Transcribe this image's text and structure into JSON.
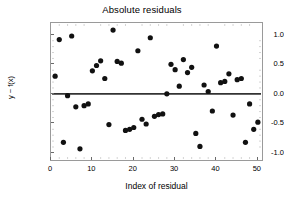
{
  "chart_data": {
    "type": "scatter",
    "title": "Absolute residuals",
    "xlabel": "Index of residual",
    "ylabel": "y − f(x)",
    "xlim": [
      0,
      51
    ],
    "ylim": [
      -1.12,
      1.2
    ],
    "grid": false,
    "legend": null,
    "marker": {
      "shape": "circle",
      "color": "#111111",
      "size_px": 5.2
    },
    "reference_line": {
      "orientation": "horizontal",
      "y": 0.0,
      "color": "#333333",
      "width_px": 1.8
    },
    "xticks": [
      0,
      10,
      20,
      30,
      40,
      50
    ],
    "xtick_labels": [
      "0",
      "10",
      "20",
      "30",
      "40",
      "50"
    ],
    "yticks": [
      -1.0,
      -0.5,
      0.0,
      0.5,
      1.0
    ],
    "ytick_labels": [
      "-1.0",
      "-0.5",
      "0.0",
      "0.5",
      "1.0"
    ],
    "x": [
      1,
      2,
      3,
      4,
      5,
      6,
      7,
      8,
      9,
      10,
      11,
      12,
      13,
      14,
      15,
      16,
      17,
      18,
      19,
      20,
      21,
      22,
      23,
      24,
      25,
      26,
      27,
      28,
      29,
      30,
      31,
      32,
      33,
      34,
      35,
      36,
      37,
      38,
      39,
      40,
      41,
      42,
      43,
      44,
      45,
      46,
      47,
      48,
      49,
      50
    ],
    "y": [
      0.3,
      0.92,
      -0.82,
      -0.03,
      0.98,
      -0.22,
      -0.93,
      -0.2,
      -0.17,
      0.39,
      0.48,
      0.56,
      0.26,
      -0.52,
      1.08,
      0.55,
      0.52,
      -0.62,
      -0.6,
      -0.57,
      0.73,
      -0.43,
      -0.51,
      0.95,
      -0.38,
      -0.35,
      -0.34,
      0.0,
      0.5,
      0.41,
      0.13,
      0.58,
      0.36,
      0.45,
      -0.67,
      -0.89,
      0.15,
      0.04,
      -0.29,
      0.81,
      0.19,
      0.21,
      0.34,
      -0.36,
      0.24,
      0.26,
      -0.82,
      -0.17,
      -0.6,
      -0.48
    ],
    "points": [
      {
        "x": 1,
        "y": 0.3
      },
      {
        "x": 2,
        "y": 0.92
      },
      {
        "x": 3,
        "y": -0.82
      },
      {
        "x": 4,
        "y": -0.03
      },
      {
        "x": 5,
        "y": 0.98
      },
      {
        "x": 6,
        "y": -0.22
      },
      {
        "x": 7,
        "y": -0.93
      },
      {
        "x": 8,
        "y": -0.2
      },
      {
        "x": 9,
        "y": -0.17
      },
      {
        "x": 10,
        "y": 0.39
      },
      {
        "x": 11,
        "y": 0.48
      },
      {
        "x": 12,
        "y": 0.56
      },
      {
        "x": 13,
        "y": 0.26
      },
      {
        "x": 14,
        "y": -0.52
      },
      {
        "x": 15,
        "y": 1.08
      },
      {
        "x": 16,
        "y": 0.55
      },
      {
        "x": 17,
        "y": 0.52
      },
      {
        "x": 18,
        "y": -0.62
      },
      {
        "x": 19,
        "y": -0.6
      },
      {
        "x": 20,
        "y": -0.57
      },
      {
        "x": 21,
        "y": 0.73
      },
      {
        "x": 22,
        "y": -0.43
      },
      {
        "x": 23,
        "y": -0.51
      },
      {
        "x": 24,
        "y": 0.95
      },
      {
        "x": 25,
        "y": -0.38
      },
      {
        "x": 26,
        "y": -0.35
      },
      {
        "x": 27,
        "y": -0.34
      },
      {
        "x": 28,
        "y": 0.0
      },
      {
        "x": 29,
        "y": 0.5
      },
      {
        "x": 30,
        "y": 0.41
      },
      {
        "x": 31,
        "y": 0.13
      },
      {
        "x": 32,
        "y": 0.58
      },
      {
        "x": 33,
        "y": 0.36
      },
      {
        "x": 34,
        "y": 0.45
      },
      {
        "x": 35,
        "y": -0.67
      },
      {
        "x": 36,
        "y": -0.89
      },
      {
        "x": 37,
        "y": 0.15
      },
      {
        "x": 38,
        "y": 0.04
      },
      {
        "x": 39,
        "y": -0.29
      },
      {
        "x": 40,
        "y": 0.81
      },
      {
        "x": 41,
        "y": 0.19
      },
      {
        "x": 42,
        "y": 0.21
      },
      {
        "x": 43,
        "y": 0.34
      },
      {
        "x": 44,
        "y": -0.36
      },
      {
        "x": 45,
        "y": 0.24
      },
      {
        "x": 46,
        "y": 0.26
      },
      {
        "x": 47,
        "y": -0.82
      },
      {
        "x": 48,
        "y": -0.17
      },
      {
        "x": 49,
        "y": -0.6
      },
      {
        "x": 50,
        "y": -0.48
      }
    ]
  }
}
